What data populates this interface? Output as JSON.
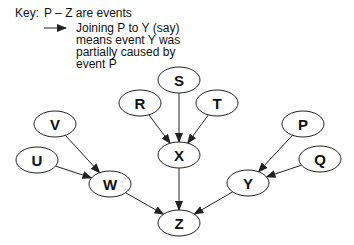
{
  "key": {
    "prefix": "Key:",
    "line1": "P – Z  are events",
    "arrow_desc": [
      "Joining P to Y (say)",
      "means event Y was",
      "partially caused by",
      "event P"
    ]
  },
  "colors": {
    "stroke": "#222222",
    "fill": "#ffffff",
    "text": "#111111"
  },
  "nodes": [
    {
      "id": "S",
      "label": "S",
      "cx": 179,
      "cy": 80
    },
    {
      "id": "R",
      "label": "R",
      "cx": 140,
      "cy": 103
    },
    {
      "id": "T",
      "label": "T",
      "cx": 217,
      "cy": 103
    },
    {
      "id": "X",
      "label": "X",
      "cx": 179,
      "cy": 155
    },
    {
      "id": "V",
      "label": "V",
      "cx": 55,
      "cy": 124
    },
    {
      "id": "U",
      "label": "U",
      "cx": 37,
      "cy": 160
    },
    {
      "id": "W",
      "label": "W",
      "cx": 110,
      "cy": 184
    },
    {
      "id": "P",
      "label": "P",
      "cx": 303,
      "cy": 124
    },
    {
      "id": "Q",
      "label": "Q",
      "cx": 320,
      "cy": 159
    },
    {
      "id": "Y",
      "label": "Y",
      "cx": 248,
      "cy": 183
    },
    {
      "id": "Z",
      "label": "Z",
      "cx": 179,
      "cy": 223
    }
  ],
  "edges": [
    {
      "from": "R",
      "to": "X"
    },
    {
      "from": "S",
      "to": "X"
    },
    {
      "from": "T",
      "to": "X"
    },
    {
      "from": "V",
      "to": "W"
    },
    {
      "from": "U",
      "to": "W"
    },
    {
      "from": "P",
      "to": "Y"
    },
    {
      "from": "Q",
      "to": "Y"
    },
    {
      "from": "W",
      "to": "Z"
    },
    {
      "from": "X",
      "to": "Z"
    },
    {
      "from": "Y",
      "to": "Z"
    }
  ]
}
